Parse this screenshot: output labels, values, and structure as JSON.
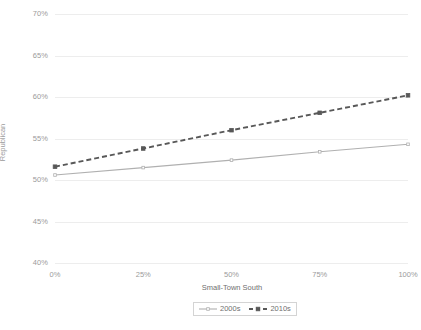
{
  "chart_data": {
    "type": "line",
    "title": "",
    "xlabel": "Small-Town South",
    "ylabel": "Republican",
    "x": [
      0,
      25,
      50,
      75,
      100
    ],
    "x_tick_labels": [
      "0%",
      "25%",
      "50%",
      "75%",
      "100%"
    ],
    "y_tick_labels": [
      "40%",
      "45%",
      "50%",
      "55%",
      "60%",
      "65%",
      "70%"
    ],
    "y_ticks": [
      40,
      45,
      50,
      55,
      60,
      65,
      70
    ],
    "ylim": [
      40,
      70
    ],
    "xlim": [
      0,
      100
    ],
    "grid": "horizontal",
    "legend_position": "bottom",
    "series": [
      {
        "name": "2000s",
        "values": [
          50.6,
          51.5,
          52.4,
          53.4,
          54.3
        ],
        "color": "#b0b0b0",
        "style": "solid",
        "marker": "small-square"
      },
      {
        "name": "2010s",
        "values": [
          51.6,
          53.8,
          56.0,
          58.1,
          60.2
        ],
        "color": "#585858",
        "style": "dashed",
        "marker": "square"
      }
    ]
  },
  "legend": {
    "items": [
      {
        "label": "2000s"
      },
      {
        "label": "2010s"
      }
    ]
  }
}
